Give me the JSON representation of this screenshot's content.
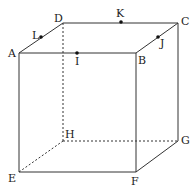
{
  "diagram": {
    "type": "cube",
    "vertices": {
      "A": {
        "label": "A",
        "x": 19,
        "y": 53
      },
      "B": {
        "label": "B",
        "x": 136,
        "y": 53
      },
      "C": {
        "label": "C",
        "x": 178,
        "y": 23
      },
      "D": {
        "label": "D",
        "x": 63,
        "y": 23
      },
      "E": {
        "label": "E",
        "x": 19,
        "y": 172
      },
      "F": {
        "label": "F",
        "x": 136,
        "y": 172
      },
      "G": {
        "label": "G",
        "x": 178,
        "y": 141
      },
      "H": {
        "label": "H",
        "x": 63,
        "y": 141
      }
    },
    "points": {
      "I": {
        "label": "I",
        "x": 77,
        "y": 53
      },
      "J": {
        "label": "J",
        "x": 158,
        "y": 37
      },
      "K": {
        "label": "K",
        "x": 121,
        "y": 22
      },
      "L": {
        "label": "L",
        "x": 41,
        "y": 37
      }
    },
    "hidden_edges": [
      "DH",
      "EH",
      "HG"
    ],
    "colors": {
      "line": "#333333"
    }
  }
}
